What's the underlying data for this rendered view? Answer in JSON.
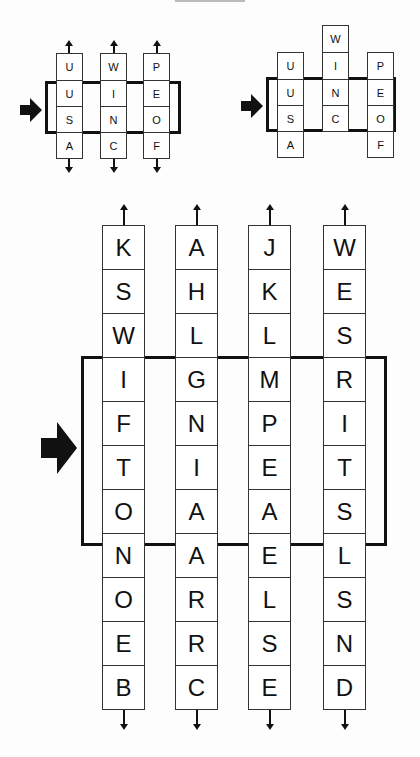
{
  "diagram": {
    "type": "slot-machine word reels",
    "small_left": {
      "label": "before",
      "columns": [
        [
          "U",
          "U",
          "S",
          "A"
        ],
        [
          "W",
          "I",
          "N",
          "C"
        ],
        [
          "P",
          "E",
          "O",
          "F"
        ]
      ],
      "frame_rows": [
        1,
        2
      ],
      "reading": [
        "U",
        "I",
        "E",
        "S",
        "N",
        "O"
      ]
    },
    "small_right": {
      "label": "after shifting middle column",
      "columns": [
        [
          "U",
          "U",
          "S",
          "A"
        ],
        [
          "W",
          "I",
          "N",
          "C"
        ],
        [
          "P",
          "E",
          "O",
          "F"
        ]
      ],
      "column_offsets": [
        0,
        -1,
        0
      ]
    },
    "large": {
      "columns": [
        [
          "K",
          "S",
          "W",
          "I",
          "F",
          "T",
          "O",
          "N",
          "O",
          "E",
          "B"
        ],
        [
          "A",
          "H",
          "L",
          "G",
          "N",
          "I",
          "A",
          "A",
          "R",
          "R",
          "C"
        ],
        [
          "J",
          "K",
          "L",
          "M",
          "P",
          "E",
          "A",
          "E",
          "L",
          "S",
          "E"
        ],
        [
          "W",
          "E",
          "S",
          "R",
          "I",
          "T",
          "S",
          "L",
          "S",
          "N",
          "D"
        ]
      ],
      "frame_rows": [
        3,
        4,
        5,
        6
      ]
    },
    "icons": {
      "pointer": "right-arrow-icon",
      "column_top": "arrow-up-icon",
      "column_bottom": "arrow-down-icon"
    }
  }
}
